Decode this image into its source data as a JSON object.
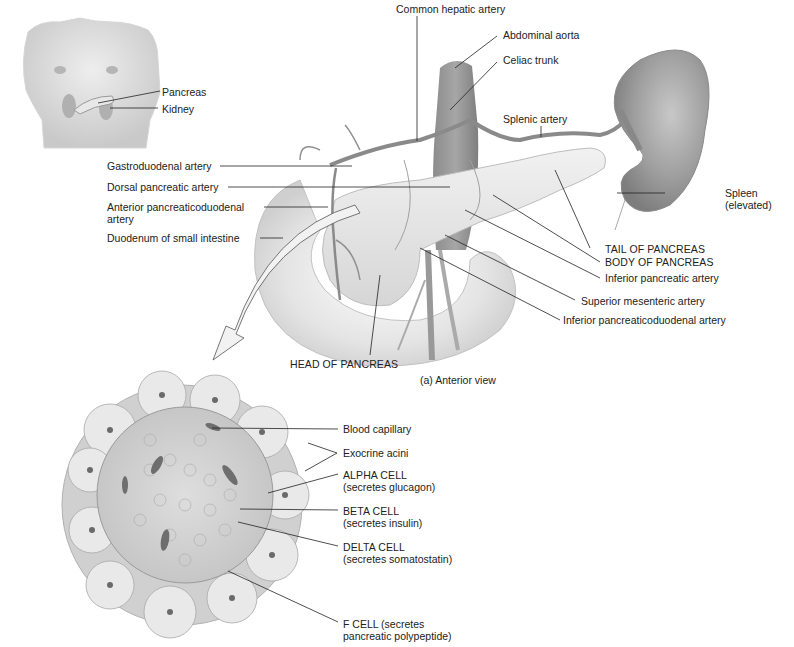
{
  "inset": {
    "labels": {
      "pancreas": "Pancreas",
      "kidney": "Kidney"
    }
  },
  "anterior_view": {
    "caption": "(a) Anterior view",
    "labels": {
      "common_hepatic_artery": "Common hepatic artery",
      "abdominal_aorta": "Abdominal aorta",
      "celiac_trunk": "Celiac trunk",
      "splenic_artery": "Splenic artery",
      "gastroduodenal_artery": "Gastroduodenal artery",
      "dorsal_pancreatic_artery": "Dorsal pancreatic artery",
      "anterior_pancreaticoduodenal_artery_1": "Anterior pancreaticoduodenal",
      "anterior_pancreaticoduodenal_artery_2": "artery",
      "duodenum": "Duodenum of small intestine",
      "spleen_1": "Spleen",
      "spleen_2": "(elevated)",
      "tail_of_pancreas": "TAIL OF PANCREAS",
      "body_of_pancreas": "BODY OF PANCREAS",
      "inferior_pancreatic_artery": "Inferior pancreatic artery",
      "superior_mesenteric_artery": "Superior mesenteric artery",
      "inferior_pancreaticoduodenal_artery": "Inferior pancreaticoduodenal artery",
      "head_of_pancreas": "HEAD OF PANCREAS"
    }
  },
  "islet_view": {
    "labels": {
      "blood_capillary": "Blood capillary",
      "exocrine_acini": "Exocrine acini",
      "alpha_cell_1": "ALPHA CELL",
      "alpha_cell_2": "(secretes glucagon)",
      "beta_cell_1": "BETA CELL",
      "beta_cell_2": "(secretes insulin)",
      "delta_cell_1": "DELTA CELL",
      "delta_cell_2": "(secretes somatostatin)",
      "f_cell_1": "F CELL (secretes",
      "f_cell_2": "pancreatic polypeptide)"
    }
  },
  "colors": {
    "background": "#ffffff",
    "tissue_light": "#e6e6e6",
    "tissue_mid": "#b8b8b8",
    "vessel": "#8a8a8a",
    "spleen": "#9a9a9a",
    "leader_line": "#222222"
  }
}
